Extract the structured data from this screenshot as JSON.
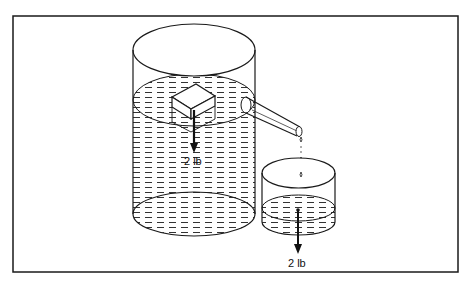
{
  "figure": {
    "labels": {
      "block_weight": "2 lb",
      "overflow_weight": "2 lb"
    },
    "colors": {
      "line": "#1a1a1a",
      "background": "#ffffff",
      "water_hatch": "#333333"
    }
  }
}
